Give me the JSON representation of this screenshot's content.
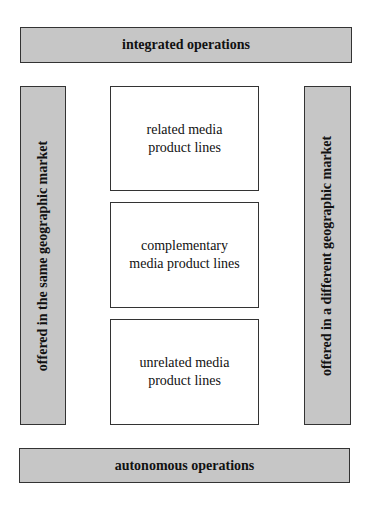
{
  "diagram": {
    "top_bar": {
      "label": "integrated operations"
    },
    "bottom_bar": {
      "label": "autonomous operations"
    },
    "left_column": {
      "label": "offered in the same geographic market"
    },
    "right_column": {
      "label": "offered in a different geographic market"
    },
    "product_lines": [
      {
        "label": "related media product lines"
      },
      {
        "label": "complementary media product lines"
      },
      {
        "label": "unrelated media product lines"
      }
    ],
    "colors": {
      "gray_fill": "#c6c6c6",
      "border": "#333333",
      "white_fill": "#ffffff"
    }
  }
}
